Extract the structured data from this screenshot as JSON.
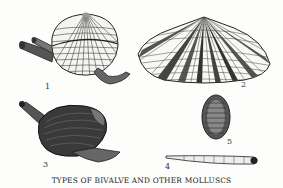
{
  "caption": "TYPES OF BIVALVE AND OTHER MOLLUSCS",
  "figures": [
    {
      "number": "1",
      "label": "scallop-like bivalve with extended siphons and foot"
    },
    {
      "number": "2",
      "label": "wedge-shaped radiating-striped bivalve shell"
    },
    {
      "number": "3",
      "label": "dark clam with siphon and foot"
    },
    {
      "number": "4",
      "label": "tusk shell"
    },
    {
      "number": "5",
      "label": "chiton"
    }
  ],
  "colors": {
    "ink": "#222222",
    "paper": "#fdfdfb"
  }
}
